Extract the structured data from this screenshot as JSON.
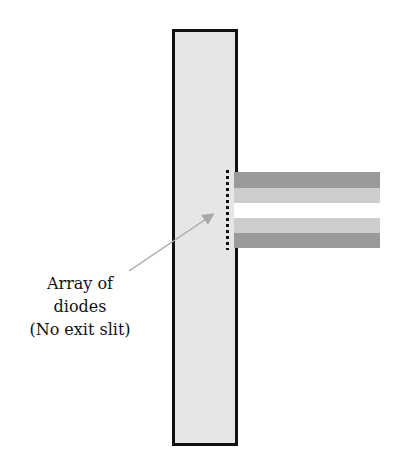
{
  "diagram": {
    "label_lines": [
      "Array of",
      "diodes",
      "(No exit slit)"
    ],
    "colors": {
      "plate_fill": "#e6e6e6",
      "outline": "#111111",
      "stripe_dark": "#9a9a9a",
      "stripe_light": "#cdcdcd",
      "stripe_white": "#ffffff",
      "arrow": "#a8a8a8"
    },
    "stripes": [
      {
        "name": "dark-top",
        "top": 172,
        "height": 16,
        "color": "#9a9a9a"
      },
      {
        "name": "light-top",
        "top": 188,
        "height": 15,
        "color": "#cdcdcd"
      },
      {
        "name": "white-middle",
        "top": 203,
        "height": 15,
        "color": "#ffffff"
      },
      {
        "name": "light-bottom",
        "top": 218,
        "height": 15,
        "color": "#cdcdcd"
      },
      {
        "name": "dark-bottom",
        "top": 233,
        "height": 15,
        "color": "#9a9a9a"
      }
    ]
  }
}
